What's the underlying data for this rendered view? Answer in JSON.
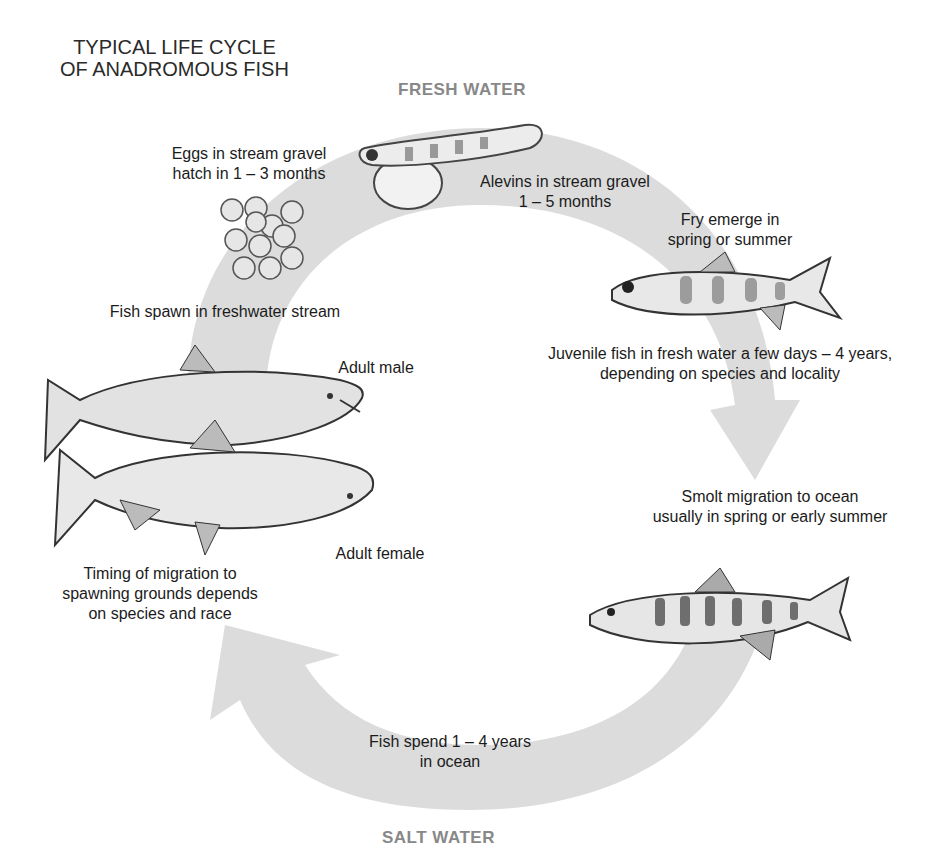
{
  "title": {
    "line1": "TYPICAL LIFE CYCLE",
    "line2": "OF ANADROMOUS FISH"
  },
  "zones": {
    "fresh": "FRESH WATER",
    "salt": "SALT WATER"
  },
  "colors": {
    "arrow": "#d9d9d9",
    "zone_label": "#888888",
    "text": "#1b1b1b"
  },
  "stages": {
    "eggs": {
      "line1": "Eggs in stream gravel",
      "line2": "hatch in 1 – 3 months"
    },
    "alevins": {
      "line1": "Alevins in stream gravel",
      "line2": "1 – 5 months"
    },
    "fry": {
      "line1": "Fry emerge in",
      "line2": "spring or summer"
    },
    "juvenile": {
      "line1": "Juvenile fish in fresh water a few days – 4 years,",
      "line2": "depending on species and locality"
    },
    "smolt": {
      "line1": "Smolt migration to ocean",
      "line2": "usually in spring or early summer"
    },
    "ocean": {
      "line1": "Fish spend 1 – 4 years",
      "line2": "in ocean"
    },
    "migration": {
      "line1": "Timing of migration to",
      "line2": "spawning grounds depends",
      "line3": "on species and race"
    },
    "spawn": {
      "line1": "Fish spawn in freshwater stream"
    },
    "adult_male": {
      "line1": "Adult male"
    },
    "adult_female": {
      "line1": "Adult female"
    }
  }
}
